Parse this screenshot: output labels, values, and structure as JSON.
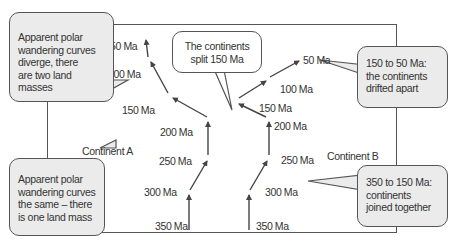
{
  "diagram": {
    "type": "apparent polar wandering curves",
    "continents": [
      {
        "name": "Continent A",
        "ages": [
          "350 Ma",
          "300 Ma",
          "250 Ma",
          "200 Ma",
          "150 Ma",
          "100 Ma",
          "50 Ma"
        ]
      },
      {
        "name": "Continent B",
        "ages": [
          "350 Ma",
          "300 Ma",
          "250 Ma",
          "200 Ma",
          "150 Ma",
          "100 Ma",
          "50 Ma"
        ]
      }
    ],
    "labels": {
      "a_50": "50 Ma",
      "a_100": "100 Ma",
      "a_150": "150 Ma",
      "a_200": "200 Ma",
      "a_250": "250 Ma",
      "a_300": "300 Ma",
      "a_350": "350 Ma",
      "b_50": "50 Ma",
      "b_100": "100 Ma",
      "b_150": "150 Ma",
      "b_200": "200 Ma",
      "b_250": "250 Ma",
      "b_300": "300 Ma",
      "b_350": "350 Ma"
    },
    "continent_a": "Continent A",
    "continent_b": "Continent B",
    "callouts": {
      "top_left": [
        "Apparent polar",
        "wandering curves",
        "diverge, there",
        "are two land masses"
      ],
      "bottom_left": [
        "Apparent polar",
        "wandering curves",
        "the same – there",
        "is one land mass"
      ],
      "top_center": [
        "The continents",
        "split 150 Ma"
      ],
      "top_right": [
        "150 to 50 Ma:",
        "the continents",
        "drifted apart"
      ],
      "bottom_right": [
        "350 to 150 Ma:",
        "continents",
        "joined together"
      ]
    },
    "colors": {
      "line": "#444444",
      "bubble_fill": "#ebebeb",
      "frame": "#555555"
    }
  }
}
